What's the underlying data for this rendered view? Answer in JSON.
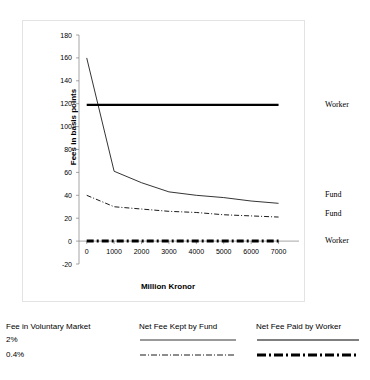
{
  "chart_data": {
    "type": "line",
    "title": "",
    "xlabel": "Million Kronor",
    "ylabel": "Fees in basis points",
    "xlim": [
      -500,
      7600
    ],
    "ylim": [
      -20,
      180
    ],
    "xticks": [
      0,
      1000,
      2000,
      3000,
      4000,
      5000,
      6000,
      7000
    ],
    "yticks": [
      -20,
      0,
      20,
      40,
      60,
      80,
      100,
      120,
      140,
      160,
      180
    ],
    "grid": false,
    "legend_position": "right-outside",
    "x": [
      0,
      1000,
      2000,
      3000,
      4000,
      5000,
      6000,
      7000
    ],
    "series": [
      {
        "name": "Net Fee Paid by Worker, 2%",
        "style": "thick-solid",
        "label": "Worker",
        "label_value": 119,
        "values": [
          119,
          119,
          119,
          119,
          119,
          119,
          119,
          119
        ]
      },
      {
        "name": "Net Fee Kept by Fund, 2%",
        "style": "thin-solid",
        "label": "Fund",
        "label_value": 40,
        "values": [
          160,
          61,
          51,
          43,
          40,
          38,
          35,
          33
        ]
      },
      {
        "name": "Net Fee Kept by Fund, 0.4%",
        "style": "thin-dash-dot",
        "label": "Fund",
        "label_value": 24,
        "values": [
          40,
          30,
          28,
          26,
          25,
          23,
          22,
          21
        ]
      },
      {
        "name": "Net Fee Paid by Worker, 0.4%",
        "style": "thick-dash-dot",
        "label": "Worker",
        "label_value": 0,
        "values": [
          0,
          0,
          0,
          0,
          0,
          0,
          0,
          0
        ]
      }
    ]
  },
  "axis": {
    "y_title": "Fees in basis points",
    "x_title": "Million Kronor",
    "y_labels": [
      "180",
      "160",
      "140",
      "120",
      "100",
      "80",
      "60",
      "40",
      "20",
      "0",
      "-20"
    ],
    "x_labels": [
      "0",
      "1000",
      "2000",
      "3000",
      "4000",
      "5000",
      "6000",
      "7000"
    ]
  },
  "series_labels": [
    {
      "text": "Worker"
    },
    {
      "text": "Fund"
    },
    {
      "text": "Fund"
    },
    {
      "text": "Worker"
    }
  ],
  "legend": {
    "columns": [
      {
        "header": "Fee in Voluntary Market",
        "rows": [
          "2%",
          "0.4%"
        ]
      },
      {
        "header": "Net Fee Kept by Fund",
        "rows": [
          "",
          ""
        ]
      },
      {
        "header": "Net Fee Paid by Worker",
        "rows": [
          "",
          ""
        ]
      }
    ]
  },
  "colors": {
    "line": "#000000",
    "axis": "#808080",
    "frame": "#e3e3e3",
    "text": "#000000"
  }
}
